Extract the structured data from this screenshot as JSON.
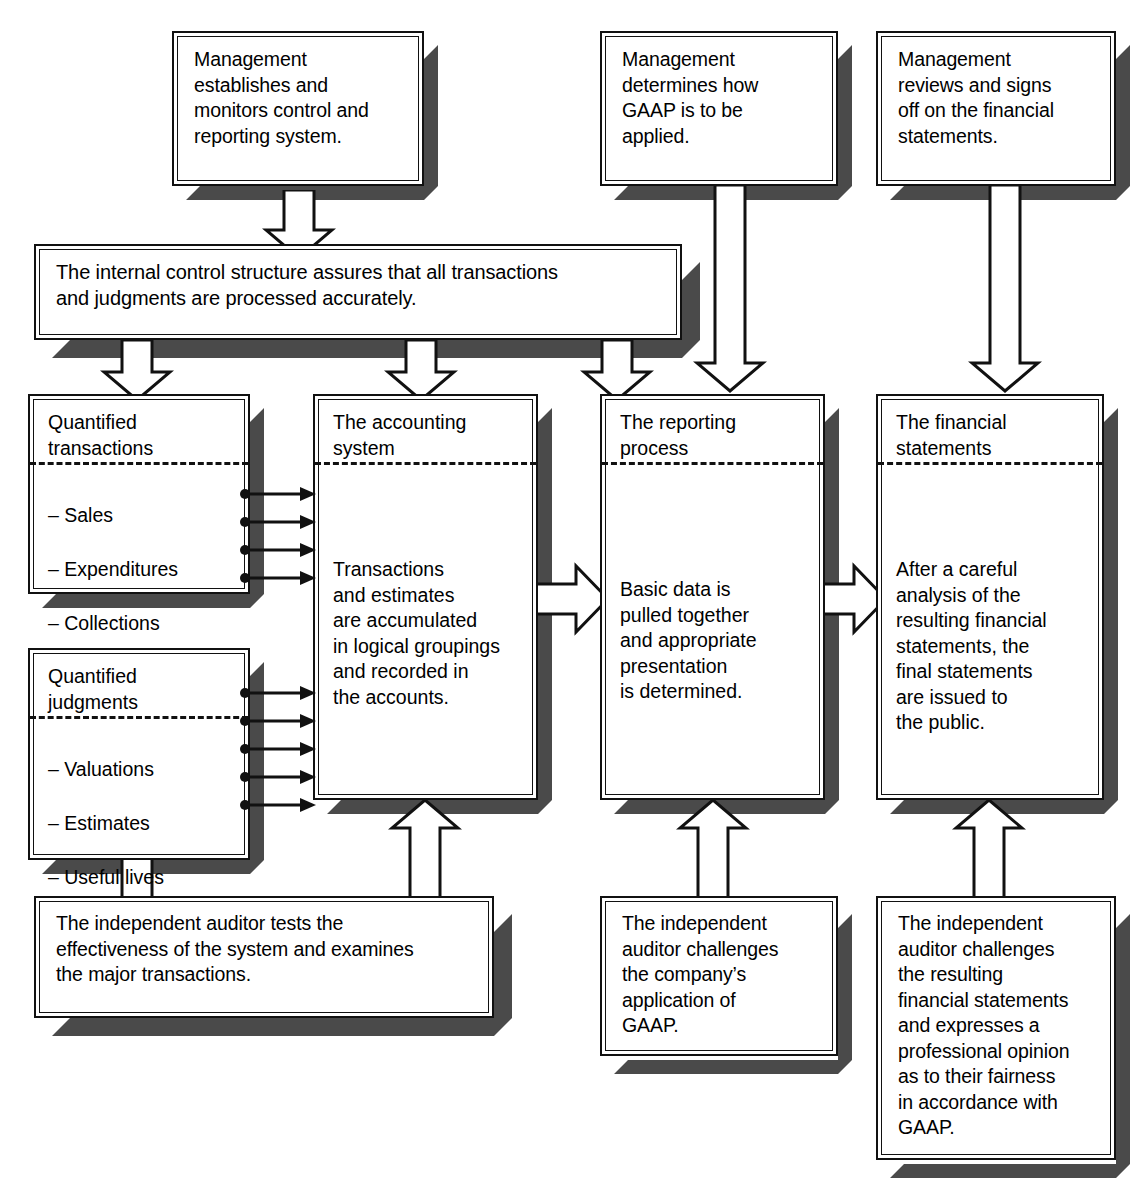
{
  "diagram": {
    "colors": {
      "ink": "#111111",
      "shadow": "#4a4a4a",
      "paper": "#ffffff"
    },
    "top_row": [
      {
        "id": "management-control",
        "text": "Management\nestablishes and\nmonitors control and\nreporting system."
      },
      {
        "id": "management-gaap",
        "text": "Management\ndetermines how\nGAAP is to be\napplied."
      },
      {
        "id": "management-signoff",
        "text": "Management\nreviews and signs\noff on the financial\nstatements."
      }
    ],
    "banner": {
      "id": "internal-control-structure",
      "text": "The internal control structure assures that all transactions\nand judgments are processed accurately."
    },
    "columns": [
      {
        "id": "quantified-transactions",
        "title": "Quantified\ntransactions",
        "items": [
          "– Sales",
          "– Expenditures",
          "– Collections",
          "– etc."
        ]
      },
      {
        "id": "quantified-judgments",
        "title": "Quantified\njudgments",
        "items": [
          "– Valuations",
          "– Estimates",
          "– Useful lives",
          "– etc."
        ]
      },
      {
        "id": "accounting-system",
        "title": "The accounting\nsystem",
        "body": "Transactions\nand estimates\nare accumulated\nin logical groupings\nand recorded in\nthe accounts."
      },
      {
        "id": "reporting-process",
        "title": "The reporting\nprocess",
        "body": "Basic data is\npulled together\nand appropriate\npresentation\nis determined."
      },
      {
        "id": "financial-statements",
        "title": "The financial\nstatements",
        "body": "After a careful\nanalysis of the\nresulting financial\nstatements, the\nfinal statements\nare issued to\nthe public."
      }
    ],
    "bottom_row": [
      {
        "id": "auditor-tests-system",
        "text": "The independent auditor tests the\neffectiveness of the system and examines\nthe major transactions."
      },
      {
        "id": "auditor-challenges-gaap",
        "text": "The independent\nauditor challenges\nthe company’s\napplication of\nGAAP."
      },
      {
        "id": "auditor-opinion",
        "text": "The independent\nauditor challenges\nthe resulting\nfinancial statements\nand expresses a\nprofessional opinion\nas to their fairness\nin accordance with\nGAAP."
      }
    ],
    "connectors": {
      "down_arrow": "down-block-arrow",
      "up_arrow": "up-block-arrow",
      "right_arrow": "right-block-arrow",
      "feed_arrow": "thin-feed-arrow"
    }
  }
}
